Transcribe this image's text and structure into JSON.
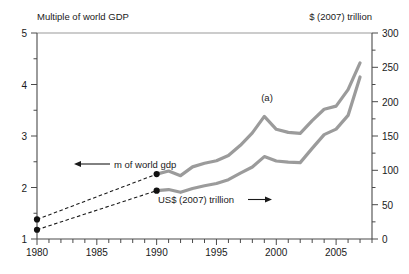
{
  "chart_data": {
    "type": "line",
    "title": "",
    "left_axis": {
      "label": "Multiple of world GDP",
      "ticks": [
        "1",
        "2",
        "3",
        "4",
        "5"
      ],
      "ylim": [
        1,
        5
      ],
      "minor_step": 0.25
    },
    "right_axis": {
      "label": "$ (2007) trillion",
      "ticks": [
        "0",
        "50",
        "100",
        "150",
        "200",
        "250",
        "300"
      ],
      "ylim": [
        0,
        300
      ],
      "minor_step": 25
    },
    "x_axis": {
      "label": "",
      "tick_labels": [
        "1980",
        "1985",
        "1990",
        "1995",
        "2000",
        "2005"
      ],
      "tick_values": [
        1980,
        1985,
        1990,
        1995,
        2000,
        2005
      ],
      "xlim": [
        1980,
        2008
      ],
      "minor_step": 1
    },
    "grid": false,
    "legend_position": "inline-annotations",
    "annotations": [
      {
        "name": "footnote-marker",
        "text": "(a)",
        "x": 1999,
        "y_left": 3.62
      },
      {
        "name": "series-label-gdp-multiple",
        "text": "m of world gdp",
        "arrow": "left"
      },
      {
        "name": "series-label-usd-trillion",
        "text": "US$ (2007) trillion",
        "arrow": "right"
      }
    ],
    "series": [
      {
        "name": "m of world gdp",
        "axis": "left",
        "style": "solid",
        "color": "#9b9b9b",
        "x": [
          1990,
          1991,
          1992,
          1993,
          1994,
          1995,
          1996,
          1997,
          1998,
          1999,
          2000,
          2001,
          2002,
          2003,
          2004,
          2005,
          2006,
          2007
        ],
        "values": [
          2.26,
          2.32,
          2.23,
          2.4,
          2.47,
          2.52,
          2.62,
          2.82,
          3.06,
          3.38,
          3.13,
          3.07,
          3.05,
          3.3,
          3.52,
          3.58,
          3.9,
          4.42
        ]
      },
      {
        "name": "US$ (2007) trillion",
        "axis": "right",
        "style": "solid",
        "color": "#9b9b9b",
        "x": [
          1990,
          1991,
          1992,
          1993,
          1994,
          1995,
          1996,
          1997,
          1998,
          1999,
          2000,
          2001,
          2002,
          2003,
          2004,
          2005,
          2006,
          2007
        ],
        "values": [
          70.4,
          72.0,
          68.0,
          73.6,
          77.6,
          80.8,
          86.4,
          96.0,
          104.8,
          120.0,
          113.6,
          112.0,
          111.2,
          132.0,
          152.0,
          160.0,
          180.0,
          236.0
        ]
      },
      {
        "name": "m of world gdp (dashed 1980-1990)",
        "axis": "left",
        "style": "dashed",
        "color": "#1a1a1a",
        "x": [
          1980,
          1990
        ],
        "values": [
          1.38,
          2.26
        ],
        "markers": true
      },
      {
        "name": "US$ (2007) trillion (dashed 1980-1990)",
        "axis": "right",
        "style": "dashed",
        "color": "#1a1a1a",
        "x": [
          1980,
          1990
        ],
        "values": [
          13.5,
          70.4
        ],
        "markers": true
      }
    ]
  }
}
